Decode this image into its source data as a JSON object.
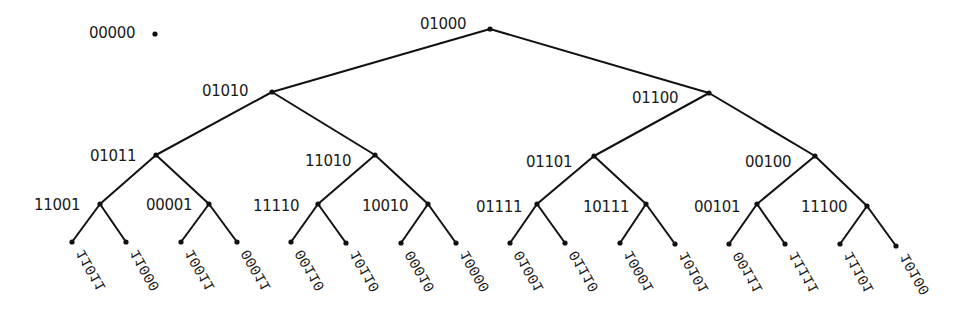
{
  "diagram": {
    "type": "binary-tree",
    "isolated_node": {
      "label": "00000",
      "x": 155,
      "y": 34
    },
    "internal_nodes": [
      {
        "id": "n0",
        "label": "01000",
        "x": 490,
        "y": 29,
        "label_dx": -70,
        "label_dy": -12
      },
      {
        "id": "n1",
        "label": "01010",
        "x": 272,
        "y": 92,
        "label_dx": -70,
        "label_dy": -8
      },
      {
        "id": "n2",
        "label": "01100",
        "x": 709,
        "y": 93,
        "label_dx": -77,
        "label_dy": -2
      },
      {
        "id": "n3",
        "label": "01011",
        "x": 156,
        "y": 155,
        "label_dx": -66,
        "label_dy": -6
      },
      {
        "id": "n4",
        "label": "11010",
        "x": 375,
        "y": 155,
        "label_dx": -70,
        "label_dy": -1
      },
      {
        "id": "n5",
        "label": "01101",
        "x": 594,
        "y": 156,
        "label_dx": -68,
        "label_dy": -1
      },
      {
        "id": "n6",
        "label": "00100",
        "x": 815,
        "y": 156,
        "label_dx": -70,
        "label_dy": -1
      },
      {
        "id": "n7",
        "label": "11001",
        "x": 100,
        "y": 204,
        "label_dx": -66,
        "label_dy": -6
      },
      {
        "id": "n8",
        "label": "00001",
        "x": 209,
        "y": 204,
        "label_dx": -63,
        "label_dy": -6
      },
      {
        "id": "n9",
        "label": "11110",
        "x": 318,
        "y": 204,
        "label_dx": -65,
        "label_dy": -5
      },
      {
        "id": "n10",
        "label": "10010",
        "x": 428,
        "y": 204,
        "label_dx": -66,
        "label_dy": -5
      },
      {
        "id": "n11",
        "label": "01111",
        "x": 537,
        "y": 204,
        "label_dx": -61,
        "label_dy": -4
      },
      {
        "id": "n12",
        "label": "10111",
        "x": 646,
        "y": 204,
        "label_dx": -63,
        "label_dy": -4
      },
      {
        "id": "n13",
        "label": "00101",
        "x": 757,
        "y": 204,
        "label_dx": -63,
        "label_dy": -4
      },
      {
        "id": "n14",
        "label": "11100",
        "x": 867,
        "y": 206,
        "label_dx": -66,
        "label_dy": -6
      }
    ],
    "leaves": [
      {
        "label": "11011",
        "x": 72,
        "y": 242,
        "parent": "n7"
      },
      {
        "label": "11000",
        "x": 126,
        "y": 242,
        "parent": "n7"
      },
      {
        "label": "10011",
        "x": 181,
        "y": 242,
        "parent": "n8"
      },
      {
        "label": "00011",
        "x": 237,
        "y": 242,
        "parent": "n8"
      },
      {
        "label": "00110",
        "x": 291,
        "y": 242,
        "parent": "n9"
      },
      {
        "label": "10110",
        "x": 346,
        "y": 243,
        "parent": "n9"
      },
      {
        "label": "00010",
        "x": 401,
        "y": 243,
        "parent": "n10"
      },
      {
        "label": "10000",
        "x": 456,
        "y": 243,
        "parent": "n10"
      },
      {
        "label": "01001",
        "x": 510,
        "y": 243,
        "parent": "n11"
      },
      {
        "label": "01110",
        "x": 565,
        "y": 243,
        "parent": "n11"
      },
      {
        "label": "10001",
        "x": 620,
        "y": 243,
        "parent": "n12"
      },
      {
        "label": "10101",
        "x": 675,
        "y": 244,
        "parent": "n12"
      },
      {
        "label": "00111",
        "x": 729,
        "y": 244,
        "parent": "n13"
      },
      {
        "label": "11111",
        "x": 785,
        "y": 244,
        "parent": "n13"
      },
      {
        "label": "11101",
        "x": 840,
        "y": 244,
        "parent": "n14"
      },
      {
        "label": "10100",
        "x": 896,
        "y": 246,
        "parent": "n14"
      }
    ],
    "internal_edges": [
      [
        "n0",
        "n1"
      ],
      [
        "n0",
        "n2"
      ],
      [
        "n1",
        "n3"
      ],
      [
        "n1",
        "n4"
      ],
      [
        "n2",
        "n5"
      ],
      [
        "n2",
        "n6"
      ],
      [
        "n3",
        "n7"
      ],
      [
        "n3",
        "n8"
      ],
      [
        "n4",
        "n9"
      ],
      [
        "n4",
        "n10"
      ],
      [
        "n5",
        "n11"
      ],
      [
        "n5",
        "n12"
      ],
      [
        "n6",
        "n13"
      ],
      [
        "n6",
        "n14"
      ]
    ],
    "colors": {
      "stroke": "#111111",
      "text": "#1a1a1a",
      "background": "#ffffff"
    }
  }
}
